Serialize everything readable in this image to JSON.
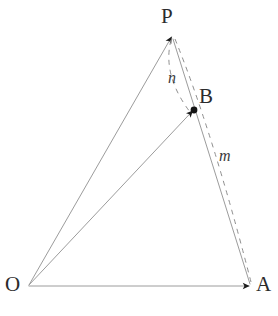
{
  "figure": {
    "background_color": "#ffffff",
    "line_color": "#9a9a9a",
    "dash_color": "#8f8f8f",
    "arrow_color": "#1a1a1a",
    "label_color": "#2b2b2b"
  },
  "points": {
    "O": {
      "label": "O",
      "x": 28,
      "y": 286
    },
    "P": {
      "label": "P",
      "x": 172,
      "y": 35
    },
    "A": {
      "label": "A",
      "x": 251,
      "y": 286
    },
    "B": {
      "label": "B",
      "x": 194,
      "y": 110
    }
  },
  "ratio_labels": {
    "n": {
      "label": "n",
      "segment": "P to B"
    },
    "m": {
      "label": "m",
      "segment": "B to A"
    }
  },
  "segments": [
    {
      "name": "OP",
      "from": "O",
      "to": "P",
      "style": "solid",
      "arrow": true
    },
    {
      "name": "OB",
      "from": "O",
      "to": "B",
      "style": "solid",
      "arrow": true
    },
    {
      "name": "OA",
      "from": "O",
      "to": "A",
      "style": "solid",
      "arrow": true
    },
    {
      "name": "PA",
      "from": "P",
      "to": "A",
      "style": "solid",
      "arrow": false
    },
    {
      "name": "PB-dashed",
      "from": "P",
      "to": "B",
      "style": "dashed",
      "arrow": false
    },
    {
      "name": "PA-dashed",
      "from": "P",
      "to": "A",
      "style": "dashed",
      "arrow": false
    }
  ]
}
